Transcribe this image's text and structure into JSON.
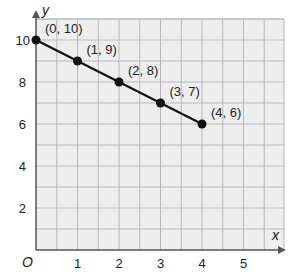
{
  "chart_data": {
    "type": "line",
    "title": "",
    "xlabel": "x",
    "ylabel": "y",
    "origin_label": "O",
    "xlim": [
      0,
      5.8
    ],
    "ylim": [
      0,
      11
    ],
    "x_ticks": [
      1,
      2,
      3,
      4,
      5
    ],
    "y_ticks": [
      2,
      4,
      6,
      8,
      10
    ],
    "grid": true,
    "legend": null,
    "series": [
      {
        "name": "line",
        "x": [
          0,
          1,
          2,
          3,
          4
        ],
        "y": [
          10,
          9,
          8,
          7,
          6
        ],
        "point_labels": [
          "(0, 10)",
          "(1, 9)",
          "(2, 8)",
          "(3, 7)",
          "(4, 6)"
        ]
      }
    ]
  },
  "colors": {
    "grid_background": "#eeeeee",
    "grid_line": "#b8b8b8",
    "axis": "#555555",
    "line": "#111111",
    "point": "#111111"
  }
}
